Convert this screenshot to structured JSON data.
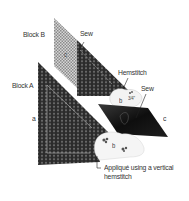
{
  "figure": {
    "labels": {
      "block_b": "Block B",
      "block_a": "Block A",
      "sew_top": "Sew",
      "hemstitch": "Hemstitch",
      "sew_right": "Sew",
      "piece_a": "a",
      "piece_b_top": "b",
      "piece_b_bottom": "b",
      "piece_c_right": "c",
      "piece_c_top": "c",
      "fraction": "3/4\"",
      "applique_line1": "Appliqué using a vertical",
      "applique_line2": "hemstitch"
    },
    "colors": {
      "dark_fabric": "#2a2a2a",
      "light_check": "#c8c8c8",
      "black_piece": "#111111",
      "applique_white": "#f4f4f4",
      "label_text": "#333333"
    }
  }
}
